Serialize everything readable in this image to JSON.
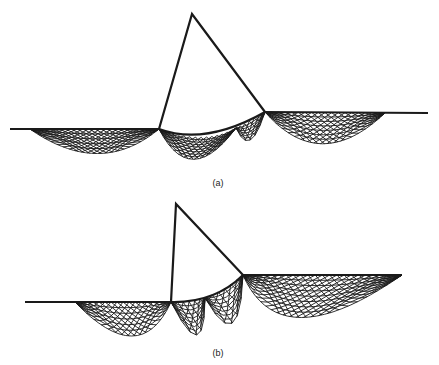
{
  "figure": {
    "line_color": "#1a1a1a",
    "background": "#ffffff",
    "panels": [
      {
        "id": "a",
        "label": "(a)"
      },
      {
        "id": "b",
        "label": "(b)"
      }
    ]
  }
}
